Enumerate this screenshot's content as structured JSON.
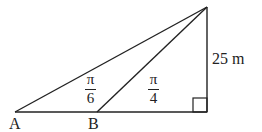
{
  "diagram": {
    "points": {
      "A": {
        "label": "A"
      },
      "B": {
        "label": "B"
      }
    },
    "angles": {
      "at_A": {
        "numerator": "π",
        "denominator": "6"
      },
      "at_B": {
        "numerator": "π",
        "denominator": "4"
      }
    },
    "height": {
      "label": "25 m"
    },
    "colors": {
      "stroke": "#222222",
      "background": "#ffffff"
    }
  }
}
